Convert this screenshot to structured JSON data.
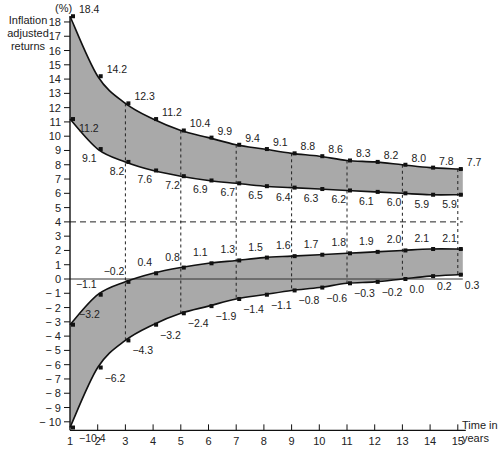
{
  "chart_data": {
    "type": "area",
    "title": "",
    "ylabel": "Inflation adjusted returns",
    "yunit": "(%)",
    "xlabel": "Time in years",
    "xlim": [
      1,
      15
    ],
    "ylim": [
      -10,
      18
    ],
    "x_ticks": [
      1,
      2,
      3,
      4,
      5,
      6,
      7,
      8,
      9,
      10,
      11,
      12,
      13,
      14,
      15
    ],
    "y_ticks": [
      -10,
      -9,
      -8,
      -7,
      -6,
      -5,
      -4,
      -3,
      -2,
      -1,
      0,
      1,
      2,
      3,
      4,
      5,
      6,
      7,
      8,
      9,
      10,
      11,
      12,
      13,
      14,
      15,
      16,
      17,
      18
    ],
    "y_tick_labels": [
      "− 10",
      "− 9",
      "− 8",
      "− 7",
      "− 6",
      "− 5",
      "− 4",
      "− 3",
      "− 2",
      "− 1",
      "0",
      "1",
      "2",
      "3",
      "4",
      "5",
      "6",
      "7",
      "8",
      "9",
      "10",
      "11",
      "12",
      "13",
      "14",
      "15",
      "16",
      "17",
      "18"
    ],
    "reference_lines": {
      "horizontal_dashed": 4,
      "horizontal_solid": 0,
      "vertical_dashed_at_years": [
        3,
        5,
        7,
        9,
        11,
        13,
        15
      ]
    },
    "grid": false,
    "fill_color": "#a9a9a9",
    "bands": [
      {
        "name": "Upper band",
        "upper": {
          "x": [
            1,
            2,
            3,
            4,
            5,
            6,
            7,
            8,
            9,
            10,
            11,
            12,
            13,
            14,
            15
          ],
          "values": [
            18.4,
            14.2,
            12.3,
            11.2,
            10.4,
            9.9,
            9.4,
            9.1,
            8.8,
            8.6,
            8.3,
            8.2,
            8.0,
            7.8,
            7.7
          ],
          "labels": [
            "18.4",
            "14.2",
            "12.3",
            "11.2",
            "10.4",
            "9.9",
            "9.4",
            "9.1",
            "8.8",
            "8.6",
            "8.3",
            "8.2",
            "8.0",
            "7.8",
            "7.7"
          ]
        },
        "lower": {
          "x": [
            1,
            2,
            3,
            4,
            5,
            6,
            7,
            8,
            9,
            10,
            11,
            12,
            13,
            14,
            15
          ],
          "values": [
            11.2,
            9.1,
            8.2,
            7.6,
            7.2,
            6.9,
            6.7,
            6.5,
            6.4,
            6.3,
            6.2,
            6.1,
            6.0,
            5.9,
            5.9
          ],
          "labels": [
            "11.2",
            "9.1",
            "8.2",
            "7.6",
            "7.2",
            "6.9",
            "6.7",
            "6.5",
            "6.4",
            "6.3",
            "6.2",
            "6.1",
            "6.0",
            "5.9",
            "5.9"
          ]
        }
      },
      {
        "name": "Lower band",
        "upper": {
          "x": [
            1,
            2,
            3,
            4,
            5,
            6,
            7,
            8,
            9,
            10,
            11,
            12,
            13,
            14,
            15
          ],
          "values": [
            -3.2,
            -1.1,
            -0.2,
            0.4,
            0.8,
            1.1,
            1.3,
            1.5,
            1.6,
            1.7,
            1.8,
            1.9,
            2.0,
            2.1,
            2.1
          ],
          "labels": [
            "−3.2",
            "−1.1",
            "−0.2",
            "0.4",
            "0.8",
            "1.1",
            "1.3",
            "1.5",
            "1.6",
            "1.7",
            "1.8",
            "1.9",
            "2.0",
            "2.1",
            "2.1"
          ]
        },
        "lower": {
          "x": [
            1,
            2,
            3,
            4,
            5,
            6,
            7,
            8,
            9,
            10,
            11,
            12,
            13,
            14,
            15
          ],
          "values": [
            -10.4,
            -6.2,
            -4.3,
            -3.2,
            -2.4,
            -1.9,
            -1.4,
            -1.1,
            -0.8,
            -0.6,
            -0.3,
            -0.2,
            0.0,
            0.2,
            0.3
          ],
          "labels": [
            "−10.4",
            "−6.2",
            "−4.3",
            "−3.2",
            "−2.4",
            "−1.9",
            "−1.4",
            "−1.1",
            "−0.8",
            "−0.6",
            "−0.3",
            "−0.2",
            "0.0",
            "0.2",
            "0.3"
          ]
        }
      }
    ]
  },
  "labels": {
    "y_axis_title_lines": [
      "Inflation",
      "adjusted",
      "returns"
    ],
    "y_unit": "(%)",
    "x_axis_title_lines": [
      "Time in",
      "years"
    ]
  }
}
